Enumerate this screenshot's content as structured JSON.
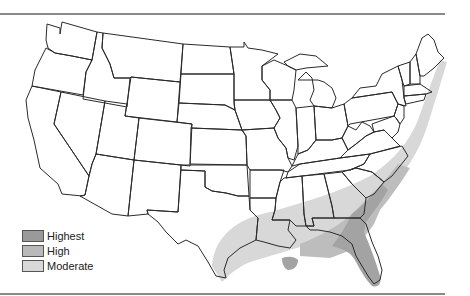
{
  "map": {
    "type": "choropleth-risk-zones",
    "region": "Contiguous United States",
    "zones": [
      {
        "level": "Highest",
        "color": "#9a9a9a",
        "area": "Florida peninsula, coastal Georgia and South Carolina, southern Louisiana delta"
      },
      {
        "level": "High",
        "color": "#b9b9b9",
        "area": "Gulf coast band (AL, MS, FL panhandle), inland Georgia and Carolinas, NC coast"
      },
      {
        "level": "Moderate",
        "color": "#d8d8d8",
        "area": "Texas Gulf coast, Louisiana, interior Southeast band, Mid-Atlantic and New England coastal strip"
      }
    ]
  },
  "legend": {
    "items": [
      {
        "label": "Highest",
        "color": "#9a9a9a"
      },
      {
        "label": "High",
        "color": "#b9b9b9"
      },
      {
        "label": "Moderate",
        "color": "#d8d8d8"
      }
    ]
  },
  "colors": {
    "outline": "#2a2a2a",
    "rule": "#8a8a8a",
    "background": "#ffffff"
  }
}
